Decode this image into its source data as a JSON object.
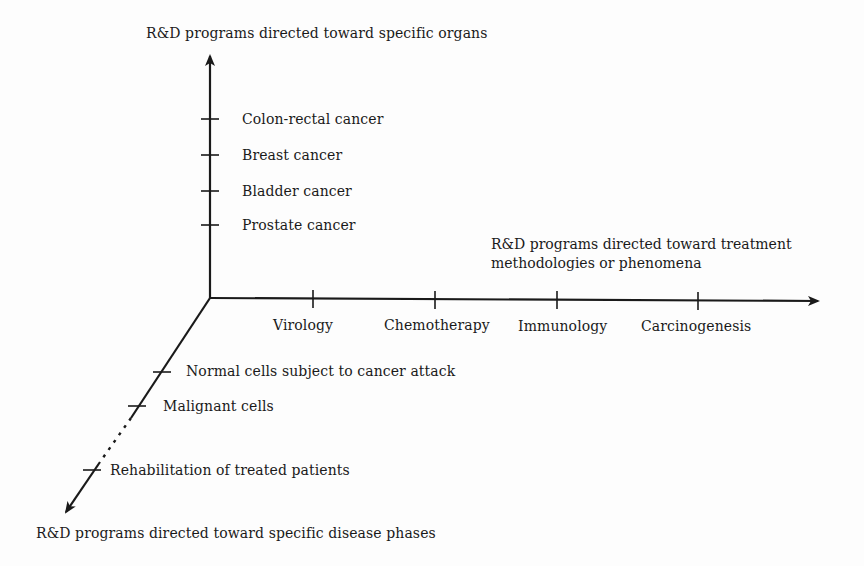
{
  "diagram": {
    "type": "three-axis concept diagram",
    "origin": [
      210,
      298
    ],
    "axes": {
      "vertical": {
        "title": "R&D programs directed toward specific organs",
        "ticks": [
          {
            "label": "Colon-rectal cancer",
            "y": 119
          },
          {
            "label": "Breast cancer",
            "y": 155
          },
          {
            "label": "Bladder cancer",
            "y": 191
          },
          {
            "label": "Prostate cancer",
            "y": 225
          }
        ]
      },
      "horizontal": {
        "title_line1": "R&D programs directed toward treatment",
        "title_line2": "methodologies or phenomena",
        "ticks": [
          {
            "label": "Virology",
            "x": 313
          },
          {
            "label": "Chemotherapy",
            "x": 435
          },
          {
            "label": "Immunology",
            "x": 557
          },
          {
            "label": "Carcinogenesis",
            "x": 698
          }
        ]
      },
      "diagonal": {
        "title": "R&D programs directed toward specific disease phases",
        "ticks": [
          {
            "label": "Normal cells subject to cancer attack"
          },
          {
            "label": "Malignant cells"
          },
          {
            "label": "Rehabilitation of treated patients"
          }
        ],
        "dashed_segment": "between Malignant cells and Rehabilitation of treated patients"
      }
    }
  },
  "colors": {
    "ink": "#1a1a1a",
    "background": "#fdfdfd"
  }
}
